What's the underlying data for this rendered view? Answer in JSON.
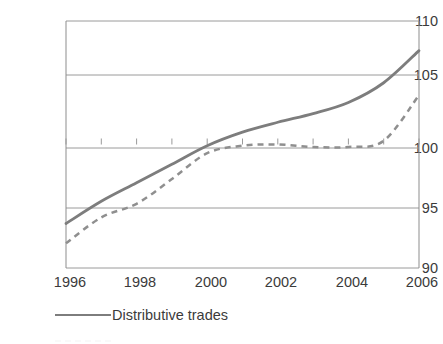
{
  "chart_data": {
    "type": "line",
    "title": "",
    "xlabel": "",
    "ylabel": "",
    "xlim": [
      1996,
      2006
    ],
    "ylim": [
      90,
      110
    ],
    "yticks": [
      90,
      95,
      100,
      105,
      110
    ],
    "xticks": [
      1996,
      1998,
      2000,
      2002,
      2004,
      2006
    ],
    "grid": true,
    "legend_position": "bottom-left",
    "x": [
      1996,
      1997,
      1998,
      1999,
      2000,
      2001,
      2002,
      2003,
      2004,
      2005,
      2006
    ],
    "series": [
      {
        "name": "Distributive trades",
        "style": "solid",
        "color": "#7d7d7d",
        "values": [
          93.6,
          95.4,
          96.9,
          98.4,
          99.9,
          101.0,
          101.8,
          102.5,
          103.4,
          105.0,
          107.6
        ]
      },
      {
        "name": "",
        "style": "dashed",
        "color": "#8f8f8f",
        "values": [
          92.0,
          94.1,
          95.2,
          97.2,
          99.3,
          99.9,
          100.0,
          99.8,
          99.8,
          100.3,
          104.0
        ]
      }
    ]
  },
  "axes": {
    "y_tick_labels": [
      "110",
      "105",
      "100",
      "95",
      "90"
    ],
    "x_tick_labels": [
      "1996",
      "1998",
      "2000",
      "2002",
      "2004",
      "2006"
    ]
  },
  "legend": {
    "items": [
      {
        "label": "Distributive trades",
        "style": "solid"
      },
      {
        "label": "",
        "style": "dashed"
      }
    ]
  },
  "colors": {
    "series_solid": "#7d7d7d",
    "series_dashed": "#8f8f8f",
    "gridline": "#9a9a9a",
    "axis": "#8d8d8d",
    "text": "#3b3b3b",
    "background": "#ffffff"
  }
}
